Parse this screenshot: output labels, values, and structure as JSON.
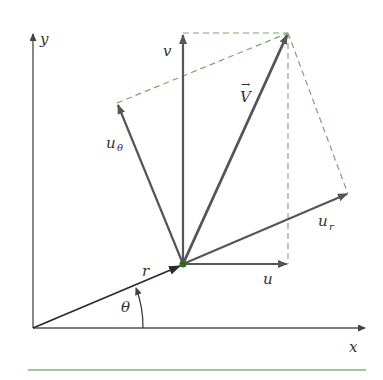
{
  "diagram": {
    "colors": {
      "vector": "#555555",
      "r_vector": "#2a2a2a",
      "dashed": "#7aa86a",
      "point": "#2f6b1f",
      "baseline": "#4d8a3a"
    },
    "labels": {
      "y_axis": "y",
      "x_axis": "x",
      "v": "v",
      "u": "u",
      "V": "V",
      "V_arrow": "→",
      "u_theta_base": "u",
      "u_theta_sub": "θ",
      "u_r_base": "u",
      "u_r_sub": "r",
      "r": "r",
      "theta": "θ"
    },
    "points": {
      "origin": [
        33,
        328
      ],
      "P": [
        183,
        264
      ],
      "V_tip": [
        288,
        33
      ],
      "v_tip": [
        183,
        33
      ],
      "u_tip": [
        288,
        264
      ],
      "u_r_tip": [
        348,
        194
      ],
      "u_theta_tip": [
        117,
        103
      ]
    }
  }
}
